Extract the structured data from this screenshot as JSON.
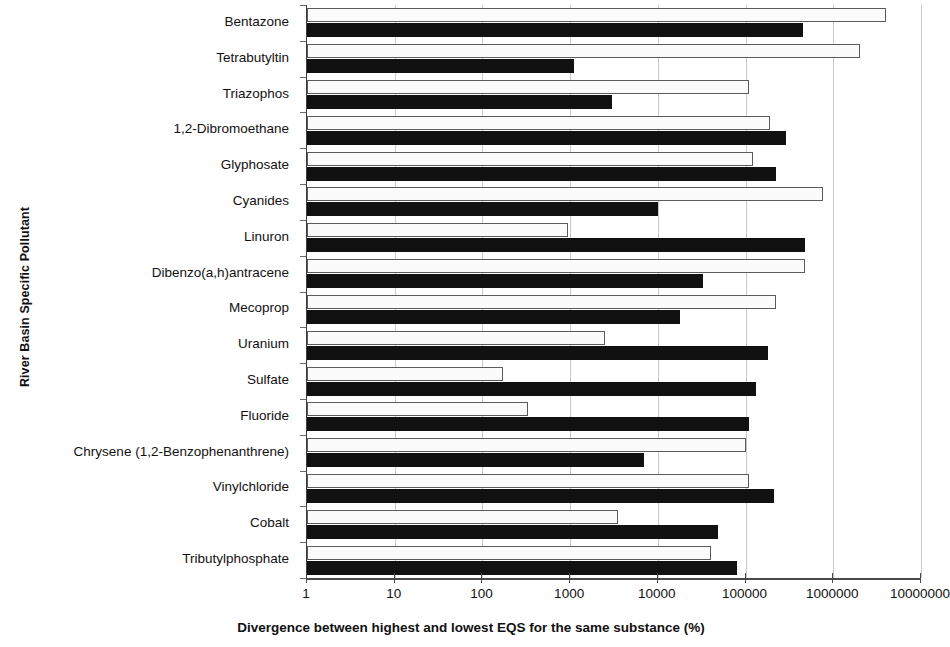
{
  "chart_data": {
    "type": "bar",
    "orientation": "horizontal",
    "title": "",
    "xlabel": "Divergence between highest and lowest EQS for the same substance (%)",
    "ylabel": "River Basin Specific Pollutant",
    "xscale": "log",
    "xlim": [
      1,
      10000000
    ],
    "xticks": [
      1,
      10,
      100,
      1000,
      10000,
      100000,
      1000000,
      10000000
    ],
    "xtick_labels": [
      "1",
      "10",
      "100",
      "1000",
      "10000",
      "100000",
      "1000000",
      "10000000"
    ],
    "grid": "vertical",
    "legend": "none",
    "categories": [
      "Bentazone",
      "Tetrabutyltin",
      "Triazophos",
      "1,2-Dibromoethane",
      "Glyphosate",
      "Cyanides",
      "Linuron",
      "Dibenzo(a,h)antracene",
      "Mecoprop",
      "Uranium",
      "Sulfate",
      "Fluoride",
      "Chrysene (1,2-Benzophenanthrene)",
      "Vinylchloride",
      "Cobalt",
      "Tributylphosphate"
    ],
    "series": [
      {
        "name": "white-series",
        "style": "open-bar",
        "color": "#fbfbfb",
        "edge_color": "#5a5a5a",
        "values": [
          4000000,
          2000000,
          110000,
          190000,
          120000,
          770000,
          950,
          480000,
          220000,
          2500,
          170,
          330,
          100000,
          110000,
          3500,
          40000
        ]
      },
      {
        "name": "black-series",
        "style": "filled-bar",
        "color": "#111111",
        "values": [
          450000,
          1100,
          3000,
          290000,
          220000,
          10000,
          480000,
          33000,
          18000,
          180000,
          130000,
          110000,
          7000,
          210000,
          48000,
          80000
        ]
      }
    ]
  },
  "axes": {
    "y_title": "River Basin Specific Pollutant",
    "x_title": "Divergence between highest and lowest EQS for the same substance (%)"
  }
}
